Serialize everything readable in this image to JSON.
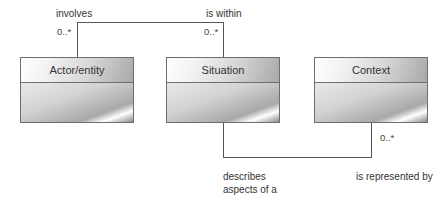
{
  "classes": [
    {
      "name": "Actor/entity"
    },
    {
      "name": "Situation"
    },
    {
      "name": "Context"
    }
  ],
  "associations": {
    "top": {
      "left_label": "involves",
      "right_label": "is within",
      "left_multiplicity": "0..*",
      "right_multiplicity": "0..*"
    },
    "bottom": {
      "left_label_line1": "describes",
      "left_label_line2": "aspects of a",
      "right_label": "is represented by",
      "right_multiplicity": "0..*"
    }
  }
}
